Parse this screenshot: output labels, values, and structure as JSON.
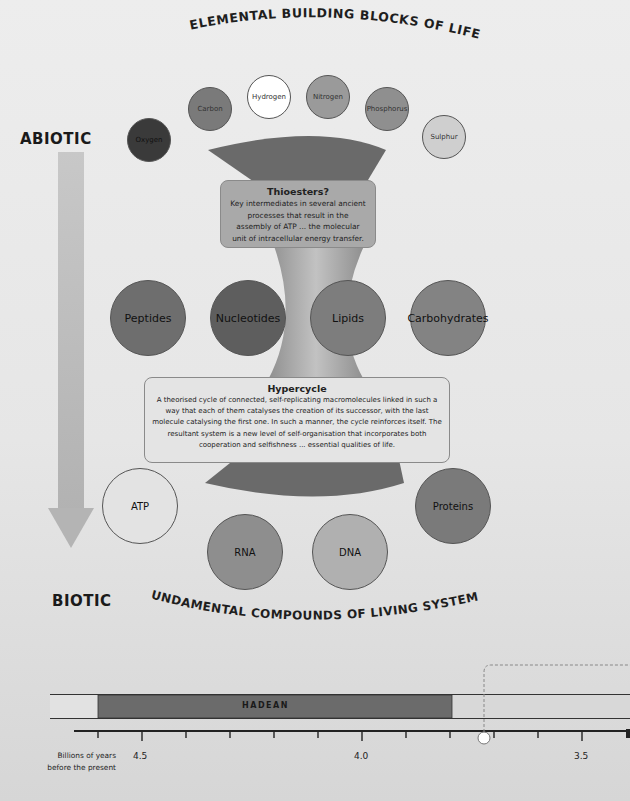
{
  "diagram": {
    "top_arc_title": "ELEMENTAL BUILDING BLOCKS OF LIFE",
    "bottom_arc_title": "FUNDAMENTAL COMPOUNDS OF LIVING SYSTEMS",
    "axis_top_label": "ABIOTIC",
    "axis_bottom_label": "BIOTIC",
    "elements": [
      {
        "label": "Oxygen",
        "color": "#3a3a3a"
      },
      {
        "label": "Carbon",
        "color": "#7a7a7a"
      },
      {
        "label": "Hydrogen",
        "color": "#ffffff"
      },
      {
        "label": "Nitrogen",
        "color": "#9a9a9a"
      },
      {
        "label": "Phosphorus",
        "color": "#8f8f8f"
      },
      {
        "label": "Sulphur",
        "color": "#cfcfcf"
      }
    ],
    "thioesters_box": {
      "title": "Thioesters?",
      "body": "Key intermediates in several ancient processes that result in the assembly of ATP ... the molecular unit of intracellular energy transfer."
    },
    "monomers": [
      {
        "label": "Peptides",
        "color": "#6e6e6e"
      },
      {
        "label": "Nucleotides",
        "color": "#5e5e5e"
      },
      {
        "label": "Lipids",
        "color": "#7d7d7d"
      },
      {
        "label": "Carbohydrates",
        "color": "#838383"
      }
    ],
    "hypercycle_box": {
      "title": "Hypercycle",
      "body": "A theorised cycle of connected, self-replicating macromolecules linked in such a way that each of them catalyses the creation of its successor, with the last molecule catalysing the first one. In such a manner, the cycle reinforces itself. The resultant system is a new level of self-organisation that incorporates both cooperation and selfishness ... essential qualities of life."
    },
    "compounds": [
      {
        "label": "ATP",
        "color": "#e3e3e3"
      },
      {
        "label": "RNA",
        "color": "#8e8e8e"
      },
      {
        "label": "DNA",
        "color": "#b0b0b0"
      },
      {
        "label": "Proteins",
        "color": "#7a7a7a"
      }
    ]
  },
  "timeline": {
    "eon_label": "HADEAN",
    "axis_caption_line1": "Billions of years",
    "axis_caption_line2": "before the present",
    "tick_labels": [
      "4.5",
      "4.0",
      "3.5"
    ]
  },
  "colors": {
    "funnel_dark": "#6a6a6a",
    "funnel_light": "#a8a8a8",
    "box_fill": "#a9a9a9",
    "hypercycle_fill": "#e4e4e4",
    "arrow": "#bdbdbd",
    "hadean": "#6b6b6b"
  }
}
